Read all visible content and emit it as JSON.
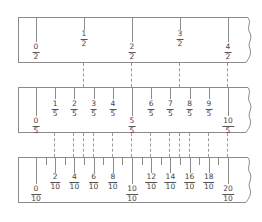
{
  "strips": [
    {
      "name": "halves",
      "denominator": 2,
      "labels": [
        {
          "num": "0",
          "den": "2",
          "pos": 0,
          "level": "low"
        },
        {
          "num": "1",
          "den": "2",
          "pos": 1,
          "level": "high"
        },
        {
          "num": "2",
          "den": "2",
          "pos": 2,
          "level": "low"
        },
        {
          "num": "3",
          "den": "2",
          "pos": 3,
          "level": "high"
        },
        {
          "num": "4",
          "den": "2",
          "pos": 4,
          "level": "low"
        }
      ]
    },
    {
      "name": "fifths",
      "denominator": 5,
      "labels": [
        {
          "num": "0",
          "den": "5"
        },
        {
          "num": "1",
          "den": "5"
        },
        {
          "num": "2",
          "den": "5"
        },
        {
          "num": "3",
          "den": "5"
        },
        {
          "num": "4",
          "den": "5"
        },
        {
          "num": "5",
          "den": "5"
        },
        {
          "num": "6",
          "den": "5"
        },
        {
          "num": "7",
          "den": "5"
        },
        {
          "num": "8",
          "den": "5"
        },
        {
          "num": "9",
          "den": "5"
        },
        {
          "num": "10",
          "den": "5"
        }
      ]
    },
    {
      "name": "tenths",
      "denominator": 10,
      "labels": [
        {
          "num": "0",
          "den": "10"
        },
        {
          "num": "2",
          "den": "10"
        },
        {
          "num": "4",
          "den": "10"
        },
        {
          "num": "6",
          "den": "10"
        },
        {
          "num": "8",
          "den": "10"
        },
        {
          "num": "10",
          "den": "10"
        },
        {
          "num": "12",
          "den": "10"
        },
        {
          "num": "14",
          "den": "10"
        },
        {
          "num": "16",
          "den": "10"
        },
        {
          "num": "18",
          "den": "10"
        },
        {
          "num": "20",
          "den": "10"
        }
      ]
    }
  ],
  "range": {
    "min": 0,
    "max": 2
  },
  "colors": {
    "line": "#8a8a8a",
    "text": "#444444",
    "dash": "#999999"
  }
}
